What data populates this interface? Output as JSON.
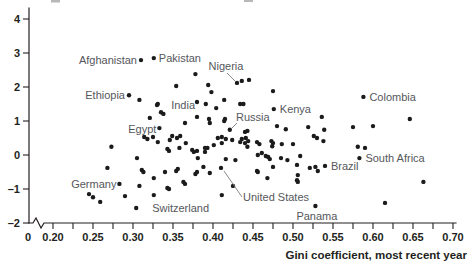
{
  "chart_data": {
    "type": "scatter",
    "title": "",
    "xlabel": "Gini coefficient, most recent year",
    "ylabel": "",
    "xlim": [
      0.2,
      0.7
    ],
    "ylim": [
      -2,
      4
    ],
    "grid": false,
    "legend": "none",
    "axis_break_before": 0.2,
    "x_origin_label": "0",
    "x_major_ticks": [
      "0.20",
      "0.25",
      "0.30",
      "0.35",
      "0.40",
      "0.45",
      "0.50",
      "0.55",
      "0.60",
      "0.65",
      "0.70"
    ],
    "x_minor_tick_step": 0.025,
    "y_ticks": [
      "4",
      "3",
      "2",
      "1",
      "0",
      "–1",
      "–2"
    ],
    "y_tick_values": [
      4,
      3,
      2,
      1,
      0,
      -1,
      -2
    ],
    "marker_color": "#1b1b1b",
    "labeled_points": [
      {
        "name": "Afghanistan",
        "x": 0.31,
        "y": 2.79,
        "anchor": "end",
        "dx": -4,
        "dy": 4
      },
      {
        "name": "Pakistan",
        "x": 0.326,
        "y": 2.85,
        "anchor": "start",
        "dx": 5,
        "dy": 4
      },
      {
        "name": "Nigeria",
        "x": 0.43,
        "y": 2.12,
        "anchor": "middle",
        "dx": -11,
        "dy": -13,
        "leader": [
          227,
          73,
          235,
          81
        ]
      },
      {
        "name": "Ethiopia",
        "x": 0.295,
        "y": 1.76,
        "anchor": "end",
        "dx": -4,
        "dy": 4
      },
      {
        "name": "India",
        "x": 0.38,
        "y": 1.56,
        "anchor": "end",
        "dx": -2,
        "dy": 7
      },
      {
        "name": "Egypt",
        "x": 0.333,
        "y": 0.79,
        "anchor": "end",
        "dx": -3,
        "dy": 5
      },
      {
        "name": "Russia",
        "x": 0.421,
        "y": 0.74,
        "anchor": "middle",
        "dx": 23,
        "dy": -9,
        "leader": [
          237,
          123,
          232,
          128
        ]
      },
      {
        "name": "Kenya",
        "x": 0.476,
        "y": 1.35,
        "anchor": "start",
        "dx": 6,
        "dy": 4
      },
      {
        "name": "Colombia",
        "x": 0.588,
        "y": 1.71,
        "anchor": "start",
        "dx": 6,
        "dy": 4
      },
      {
        "name": "South Africa",
        "x": 0.583,
        "y": -0.09,
        "anchor": "start",
        "dx": 6,
        "dy": 4
      },
      {
        "name": "Brazil",
        "x": 0.54,
        "y": -0.32,
        "anchor": "start",
        "dx": 6,
        "dy": 4
      },
      {
        "name": "Germany",
        "x": 0.283,
        "y": -0.85,
        "anchor": "end",
        "dx": -3,
        "dy": 4
      },
      {
        "name": "Switzerland",
        "x": 0.304,
        "y": -1.56,
        "anchor": "start",
        "dx": 16,
        "dy": 4
      },
      {
        "name": "United States",
        "x": 0.41,
        "y": -0.38,
        "anchor": "start",
        "dx": 22,
        "dy": 33,
        "leader": [
          242,
          197,
          224,
          171
        ]
      },
      {
        "name": "Panama",
        "x": 0.528,
        "y": -1.5,
        "anchor": "start",
        "dx": -19,
        "dy": 14
      }
    ],
    "points": [
      [
        0.378,
        2.38
      ],
      [
        0.436,
        2.18
      ],
      [
        0.445,
        2.21
      ],
      [
        0.354,
        2.03
      ],
      [
        0.394,
        2.06
      ],
      [
        0.398,
        1.85
      ],
      [
        0.308,
        1.62
      ],
      [
        0.33,
        1.47
      ],
      [
        0.475,
        1.88
      ],
      [
        0.391,
        1.5
      ],
      [
        0.331,
        1.5
      ],
      [
        0.404,
        1.38
      ],
      [
        0.414,
        1.62
      ],
      [
        0.434,
        1.5
      ],
      [
        0.438,
        1.5
      ],
      [
        0.335,
        1.26
      ],
      [
        0.338,
        1.21
      ],
      [
        0.321,
        1.09
      ],
      [
        0.395,
        1.06
      ],
      [
        0.415,
        1.06
      ],
      [
        0.536,
        1.12
      ],
      [
        0.646,
        1.06
      ],
      [
        0.365,
        0.94
      ],
      [
        0.38,
        1.12
      ],
      [
        0.396,
        0.94
      ],
      [
        0.414,
        1.0
      ],
      [
        0.443,
        0.71
      ],
      [
        0.48,
        0.85
      ],
      [
        0.491,
        0.76
      ],
      [
        0.519,
        0.82
      ],
      [
        0.539,
        0.74
      ],
      [
        0.575,
        0.82
      ],
      [
        0.6,
        0.85
      ],
      [
        0.314,
        0.53
      ],
      [
        0.318,
        0.47
      ],
      [
        0.346,
        0.44
      ],
      [
        0.349,
        0.56
      ],
      [
        0.366,
        0.35
      ],
      [
        0.358,
        0.21
      ],
      [
        0.374,
        0.15
      ],
      [
        0.376,
        0.09
      ],
      [
        0.38,
        0.12
      ],
      [
        0.39,
        0.09
      ],
      [
        0.401,
        0.29
      ],
      [
        0.406,
        0.5
      ],
      [
        0.411,
        0.53
      ],
      [
        0.411,
        0.35
      ],
      [
        0.416,
        0.47
      ],
      [
        0.434,
        0.38
      ],
      [
        0.436,
        0.47
      ],
      [
        0.44,
        0.68
      ],
      [
        0.441,
        0.5
      ],
      [
        0.444,
        0.41
      ],
      [
        0.44,
        0.35
      ],
      [
        0.455,
        0.38
      ],
      [
        0.458,
        0.32
      ],
      [
        0.473,
        0.41
      ],
      [
        0.475,
        0.35
      ],
      [
        0.474,
        0.26
      ],
      [
        0.5,
        0.32
      ],
      [
        0.526,
        0.56
      ],
      [
        0.53,
        0.5
      ],
      [
        0.456,
        0.0
      ],
      [
        0.461,
        0.06
      ],
      [
        0.466,
        -0.03
      ],
      [
        0.469,
        -0.06
      ],
      [
        0.471,
        -0.12
      ],
      [
        0.485,
        -0.09
      ],
      [
        0.509,
        -0.03
      ],
      [
        0.273,
        0.24
      ],
      [
        0.325,
        0.53
      ],
      [
        0.331,
        0.38
      ],
      [
        0.355,
        0.5
      ],
      [
        0.359,
        0.56
      ],
      [
        0.343,
        0.18
      ],
      [
        0.345,
        0.12
      ],
      [
        0.305,
        -0.09
      ],
      [
        0.268,
        -0.38
      ],
      [
        0.311,
        -0.44
      ],
      [
        0.313,
        -0.5
      ],
      [
        0.34,
        -0.5
      ],
      [
        0.326,
        -0.68
      ],
      [
        0.354,
        -0.47
      ],
      [
        0.356,
        -0.41
      ],
      [
        0.381,
        -0.09
      ],
      [
        0.388,
        -0.35
      ],
      [
        0.378,
        -0.56
      ],
      [
        0.38,
        -0.5
      ],
      [
        0.363,
        -0.79
      ],
      [
        0.365,
        -0.85
      ],
      [
        0.343,
        -0.97
      ],
      [
        0.345,
        -1.0
      ],
      [
        0.308,
        -0.91
      ],
      [
        0.29,
        -1.21
      ],
      [
        0.326,
        -1.18
      ],
      [
        0.245,
        -1.15
      ],
      [
        0.25,
        -1.24
      ],
      [
        0.259,
        -1.38
      ],
      [
        0.39,
        0.21
      ],
      [
        0.393,
        0.21
      ],
      [
        0.424,
        0.44
      ],
      [
        0.443,
        0.24
      ],
      [
        0.416,
        -0.12
      ],
      [
        0.428,
        -0.15
      ],
      [
        0.396,
        -0.53
      ],
      [
        0.425,
        -0.91
      ],
      [
        0.411,
        -1.18
      ],
      [
        0.455,
        -0.47
      ],
      [
        0.456,
        -0.5
      ],
      [
        0.475,
        -0.35
      ],
      [
        0.468,
        -0.68
      ],
      [
        0.486,
        0.32
      ],
      [
        0.493,
        -0.15
      ],
      [
        0.505,
        -0.29
      ],
      [
        0.506,
        -0.59
      ],
      [
        0.505,
        -0.74
      ],
      [
        0.506,
        -0.79
      ],
      [
        0.521,
        -0.38
      ],
      [
        0.528,
        -0.35
      ],
      [
        0.531,
        -0.47
      ],
      [
        0.538,
        0.41
      ],
      [
        0.581,
        0.24
      ],
      [
        0.59,
        0.21
      ],
      [
        0.615,
        -1.41
      ],
      [
        0.663,
        -0.79
      ]
    ]
  }
}
